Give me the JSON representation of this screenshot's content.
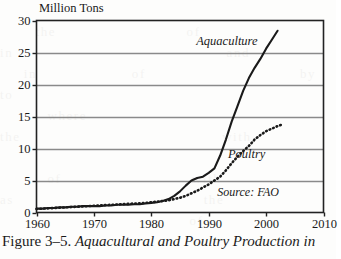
{
  "figure": {
    "caption_lead": "Figure 3–5. ",
    "caption_title": "Aquacultural and Poultry Production in",
    "source_note": "Source: FAO"
  },
  "chart_data": {
    "type": "line",
    "title": "",
    "subtitle": "",
    "xlabel": "",
    "ylabel": "Million Tons",
    "xlim": [
      1960,
      2010
    ],
    "ylim": [
      0,
      30
    ],
    "xticks": [
      1960,
      1970,
      1980,
      1990,
      2000,
      2010
    ],
    "xtick_labels": [
      "1960",
      "1970",
      "1980",
      "1990",
      "2000",
      "2010"
    ],
    "yticks": [
      0,
      5,
      10,
      15,
      20,
      25,
      30
    ],
    "ytick_labels": [
      "0",
      "5",
      "10",
      "15",
      "20",
      "25",
      "30"
    ],
    "grid": "horizontal",
    "grid_color": "#8a8a8a",
    "legend_position": "inline-annotation",
    "series": [
      {
        "name": "Aquaculture",
        "style": "solid",
        "color": "#1a1a1a",
        "label_x": 1988,
        "label_y": 26.6,
        "x": [
          1960,
          1961,
          1962,
          1963,
          1964,
          1965,
          1966,
          1967,
          1968,
          1969,
          1970,
          1971,
          1972,
          1973,
          1974,
          1975,
          1976,
          1977,
          1978,
          1979,
          1980,
          1981,
          1982,
          1983,
          1984,
          1985,
          1986,
          1987,
          1988,
          1989,
          1990,
          1991,
          1992,
          1993,
          1994,
          1995,
          1996,
          1997,
          1998,
          1999,
          2000,
          2001,
          2002
        ],
        "values": [
          0.6,
          0.6,
          0.7,
          0.7,
          0.8,
          0.8,
          0.9,
          0.9,
          1.0,
          1.0,
          1.0,
          1.0,
          1.1,
          1.1,
          1.2,
          1.2,
          1.2,
          1.3,
          1.3,
          1.4,
          1.5,
          1.6,
          1.8,
          2.1,
          2.6,
          3.3,
          4.2,
          5.0,
          5.4,
          5.6,
          6.2,
          6.9,
          8.9,
          11.4,
          14.2,
          16.6,
          19.0,
          21.0,
          22.6,
          24.0,
          25.6,
          27.0,
          28.4
        ]
      },
      {
        "name": "Poultry",
        "style": "dotted",
        "color": "#1a1a1a",
        "label_x": 1993,
        "label_y": 9.0,
        "x": [
          1960,
          1961,
          1962,
          1963,
          1964,
          1965,
          1966,
          1967,
          1968,
          1969,
          1970,
          1971,
          1972,
          1973,
          1974,
          1975,
          1976,
          1977,
          1978,
          1979,
          1980,
          1981,
          1982,
          1983,
          1984,
          1985,
          1986,
          1987,
          1988,
          1989,
          1990,
          1991,
          1992,
          1993,
          1994,
          1995,
          1996,
          1997,
          1998,
          1999,
          2000,
          2001,
          2002,
          2003
        ],
        "values": [
          0.55,
          0.6,
          0.65,
          0.7,
          0.75,
          0.8,
          0.85,
          0.9,
          0.95,
          1.0,
          1.05,
          1.1,
          1.15,
          1.2,
          1.25,
          1.3,
          1.35,
          1.4,
          1.45,
          1.5,
          1.6,
          1.7,
          1.8,
          1.9,
          2.1,
          2.3,
          2.6,
          3.0,
          3.4,
          3.9,
          4.4,
          5.0,
          5.6,
          6.6,
          7.7,
          8.7,
          9.6,
          10.4,
          11.4,
          12.1,
          12.7,
          13.1,
          13.5,
          13.8
        ]
      }
    ]
  },
  "bleed_text": "                                                                \n   the           of              in                  and          \n  in        of             by                 to                  \n    where                        the                 with         \n                                                                  \n    of           with               as                the         \n                of             the                                "
}
